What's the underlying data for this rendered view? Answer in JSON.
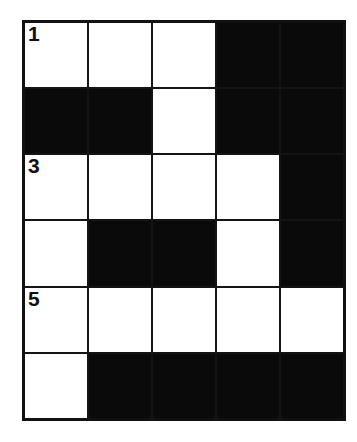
{
  "document": {
    "kind": "crossword-puzzle-grid",
    "title": "Crossword Grid",
    "background_color": "#ffffff"
  },
  "grid": {
    "columns": 5,
    "rows": 6,
    "cell_width_px": 64,
    "cell_height_px": 66,
    "colors": {
      "white_cell": "#ffffff",
      "black_cell": "#0a0a0a",
      "grid_line": "#141414",
      "outer_border": "#111111",
      "number_text": "#101010"
    },
    "legend": {
      "white": "open answer square",
      "black": "blocked square"
    },
    "cells": [
      [
        {
          "type": "white",
          "number": "1",
          "letter": ""
        },
        {
          "type": "white",
          "number": "",
          "letter": ""
        },
        {
          "type": "white",
          "number": "",
          "letter": ""
        },
        {
          "type": "black",
          "number": "",
          "letter": ""
        },
        {
          "type": "black",
          "number": "",
          "letter": ""
        }
      ],
      [
        {
          "type": "black",
          "number": "",
          "letter": ""
        },
        {
          "type": "black",
          "number": "",
          "letter": ""
        },
        {
          "type": "white",
          "number": "",
          "letter": ""
        },
        {
          "type": "black",
          "number": "",
          "letter": ""
        },
        {
          "type": "black",
          "number": "",
          "letter": ""
        }
      ],
      [
        {
          "type": "white",
          "number": "3",
          "letter": ""
        },
        {
          "type": "white",
          "number": "",
          "letter": ""
        },
        {
          "type": "white",
          "number": "",
          "letter": ""
        },
        {
          "type": "white",
          "number": "",
          "letter": ""
        },
        {
          "type": "black",
          "number": "",
          "letter": ""
        }
      ],
      [
        {
          "type": "white",
          "number": "",
          "letter": ""
        },
        {
          "type": "black",
          "number": "",
          "letter": ""
        },
        {
          "type": "black",
          "number": "",
          "letter": ""
        },
        {
          "type": "white",
          "number": "",
          "letter": ""
        },
        {
          "type": "black",
          "number": "",
          "letter": ""
        }
      ],
      [
        {
          "type": "white",
          "number": "5",
          "letter": ""
        },
        {
          "type": "white",
          "number": "",
          "letter": ""
        },
        {
          "type": "white",
          "number": "",
          "letter": ""
        },
        {
          "type": "white",
          "number": "",
          "letter": ""
        },
        {
          "type": "white",
          "number": "",
          "letter": ""
        }
      ],
      [
        {
          "type": "white",
          "number": "",
          "letter": ""
        },
        {
          "type": "black",
          "number": "",
          "letter": ""
        },
        {
          "type": "black",
          "number": "",
          "letter": ""
        },
        {
          "type": "black",
          "number": "",
          "letter": ""
        },
        {
          "type": "black",
          "number": "",
          "letter": ""
        }
      ]
    ],
    "visible_numbers": [
      "1",
      "3",
      "5"
    ]
  }
}
